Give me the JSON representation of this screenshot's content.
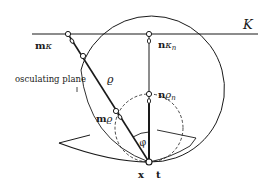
{
  "diagram": {
    "labels": {
      "plane_symbol": "Κ",
      "m_kappa_m": "m",
      "m_kappa_sym": "κ",
      "n_kappa_n": "n",
      "n_kappa_sym": "κ",
      "n_kappa_sub": "n",
      "n_rho_n": "n",
      "n_rho_sym": "ϱ",
      "n_rho_sub": "n",
      "m_rho_m": "m",
      "m_rho_sym": "ϱ",
      "rho": "ϱ",
      "phi": "φ",
      "osculating_plane": "osculating plane",
      "x": "x",
      "t": "t"
    },
    "colors": {
      "stroke": "#1a1a1a",
      "background": "#ffffff"
    }
  }
}
